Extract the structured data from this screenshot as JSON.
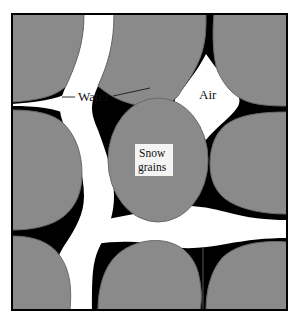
{
  "figure": {
    "kind": "schematic-cross-section",
    "caption_labels": {
      "water": "Water",
      "air": "Air",
      "snow_grains_line1": "Snow",
      "snow_grains_line2": "grains"
    },
    "colors": {
      "background": "#ffffff",
      "frame_border": "#000000",
      "snow_grain_fill": "#8a8a8a",
      "snow_grain_outline": "#6a6a6a",
      "water_fill": "#ffffff",
      "pendular_water_fill": "#000000",
      "label_text": "#111111",
      "snow_label_box_fill": "#f4f4f4"
    },
    "frame": {
      "x": 11,
      "y": 13,
      "width": 277,
      "height": 298,
      "border_width": 2
    },
    "legend_items": [
      {
        "name": "Water",
        "swatch": "#ffffff"
      },
      {
        "name": "Air",
        "swatch": "#ffffff"
      },
      {
        "name": "Snow grains",
        "swatch": "#8a8a8a"
      }
    ],
    "label_positions": {
      "water": {
        "x": 78,
        "y": 101
      },
      "air": {
        "x": 199,
        "y": 99
      },
      "snow_box": {
        "x": 135,
        "y": 144,
        "width": 38,
        "height": 32
      }
    }
  }
}
